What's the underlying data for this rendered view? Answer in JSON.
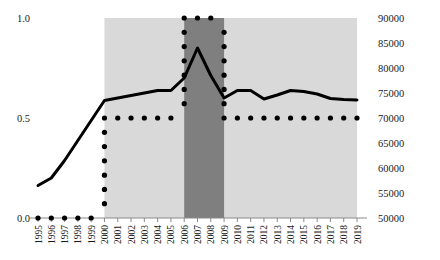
{
  "chart_data": {
    "type": "line",
    "title": "",
    "subtitle": "",
    "xlabel": "",
    "ylabel": "",
    "grid": false,
    "legend": "none",
    "x": [
      1995,
      1996,
      1997,
      1998,
      1999,
      2000,
      2001,
      2002,
      2003,
      2004,
      2005,
      2006,
      2007,
      2008,
      2009,
      2010,
      2011,
      2012,
      2013,
      2014,
      2015,
      2016,
      2017,
      2018,
      2019
    ],
    "xtick_labels": [
      "1995",
      "1996",
      "1997",
      "1998",
      "1999",
      "2000",
      "2001",
      "2002",
      "2003",
      "2004",
      "2005",
      "2006",
      "2007",
      "2008",
      "2009",
      "2010",
      "2011",
      "2012",
      "2013",
      "2014",
      "2015",
      "2016",
      "2017",
      "2018",
      "2019"
    ],
    "axes": {
      "left": {
        "label": "",
        "ylim": [
          0.0,
          1.0
        ],
        "ticks": [
          0.0,
          0.5,
          1.0
        ],
        "tick_labels": [
          "0.0",
          "0.5",
          "1.0"
        ]
      },
      "right": {
        "label": "",
        "ylim": [
          50000,
          90000
        ],
        "ticks": [
          50000,
          55000,
          60000,
          65000,
          70000,
          75000,
          80000,
          85000,
          90000
        ],
        "tick_labels": [
          "50000",
          "55000",
          "60000",
          "65000",
          "70000",
          "75000",
          "80000",
          "85000",
          "90000"
        ]
      }
    },
    "series": [
      {
        "name": "solid-line",
        "style": "solid",
        "axis": "right",
        "color": "#000000",
        "values": [
          56500,
          58000,
          61500,
          65500,
          69500,
          73500,
          74000,
          74500,
          75000,
          75500,
          75500,
          78000,
          84000,
          78500,
          74000,
          75500,
          75500,
          73800,
          74600,
          75500,
          75300,
          74800,
          73900,
          73700,
          73600
        ]
      },
      {
        "name": "dotted-line",
        "style": "dotted",
        "axis": "left",
        "color": "#000000",
        "values": [
          0.0,
          0.0,
          0.0,
          0.0,
          0.0,
          0.5,
          0.5,
          0.5,
          0.5,
          0.5,
          0.5,
          1.0,
          1.0,
          1.0,
          0.5,
          0.5,
          0.5,
          0.5,
          0.5,
          0.5,
          0.5,
          0.5,
          0.5,
          0.5,
          0.5
        ]
      }
    ],
    "shaded_regions": [
      {
        "name": "light-shaded-band",
        "start_year": 2000,
        "end_year": 2019,
        "color": "#d9d9d9"
      },
      {
        "name": "dark-shaded-band",
        "start_year": 2006,
        "end_year": 2009,
        "color": "#7f7f7f"
      }
    ]
  }
}
